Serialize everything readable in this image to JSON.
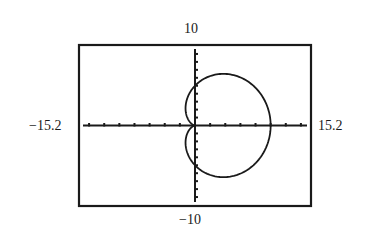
{
  "chart_data": {
    "type": "line",
    "subtype": "polar",
    "title": "",
    "equation": "r = 5 + 5cos(theta)",
    "theta_range": [
      0,
      6.2832
    ],
    "polar_params": {
      "a": 5,
      "b": 5
    },
    "window": {
      "xmin": -15.2,
      "xmax": 15.2,
      "ymin": -10,
      "ymax": 10,
      "xscl": 2,
      "yscl": 1
    },
    "tick_labels": {
      "xmin": "−15.2",
      "xmax": "15.2",
      "ymin": "−10",
      "ymax": "10"
    },
    "xlabel": "",
    "ylabel": "",
    "grid": false,
    "legend": "none",
    "colors": {
      "curve": "#1a1a1a",
      "axes": "#1a1a1a",
      "frame": "#1a1a1a"
    }
  }
}
